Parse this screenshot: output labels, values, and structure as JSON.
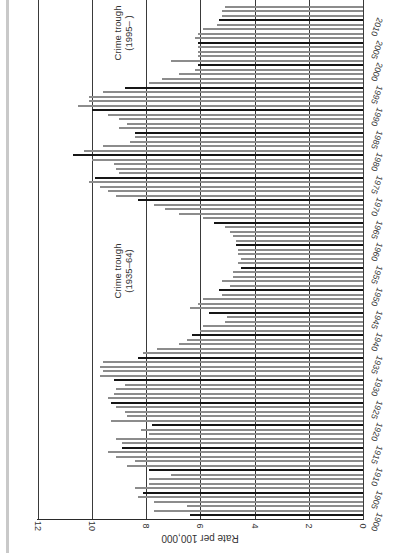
{
  "chart_data": {
    "type": "bar",
    "orientation": "rotated-90-ccw (years run bottom-to-top, values grow leftward)",
    "title": "",
    "xlabel": "",
    "ylabel": "Rate per 100,000",
    "ylim": [
      0,
      12
    ],
    "value_ticks": [
      "0",
      "2",
      "4",
      "6",
      "8",
      "10",
      "12"
    ],
    "year_ticks": [
      "1900",
      "1905",
      "1910",
      "1915",
      "1920",
      "1925",
      "1930",
      "1935",
      "1940",
      "1945",
      "1950",
      "1955",
      "1960",
      "1965",
      "1970",
      "1975",
      "1980",
      "1985",
      "1990",
      "1995",
      "2000",
      "2005",
      "2010"
    ],
    "grid": true,
    "highlight_every_5_years": true,
    "annotations": [
      {
        "line1": "Crime trough",
        "line2": "(1935–64)"
      },
      {
        "line1": "Crime trough",
        "line2": "(1995– )"
      }
    ],
    "categories": [
      1900,
      1901,
      1902,
      1903,
      1904,
      1905,
      1906,
      1907,
      1908,
      1909,
      1910,
      1911,
      1912,
      1913,
      1914,
      1915,
      1916,
      1917,
      1918,
      1919,
      1920,
      1921,
      1922,
      1923,
      1924,
      1925,
      1926,
      1927,
      1928,
      1929,
      1930,
      1931,
      1932,
      1933,
      1934,
      1935,
      1936,
      1937,
      1938,
      1939,
      1940,
      1941,
      1942,
      1943,
      1944,
      1945,
      1946,
      1947,
      1948,
      1949,
      1950,
      1951,
      1952,
      1953,
      1954,
      1955,
      1956,
      1957,
      1958,
      1959,
      1960,
      1961,
      1962,
      1963,
      1964,
      1965,
      1966,
      1967,
      1968,
      1969,
      1970,
      1971,
      1972,
      1973,
      1974,
      1975,
      1976,
      1977,
      1978,
      1979,
      1980,
      1981,
      1982,
      1983,
      1984,
      1985,
      1986,
      1987,
      1988,
      1989,
      1990,
      1991,
      1992,
      1993,
      1994,
      1995,
      1996,
      1997,
      1998,
      1999,
      2000,
      2001,
      2002,
      2003,
      2004,
      2005,
      2006,
      2007,
      2008,
      2009,
      2010,
      2011,
      2012,
      2013
    ],
    "values": [
      6.4,
      7.7,
      6.5,
      7.7,
      8.3,
      8.1,
      8.4,
      7.9,
      7.9,
      7.1,
      7.9,
      8.7,
      8.4,
      9.1,
      9.4,
      8.9,
      8.9,
      9.1,
      7.9,
      8.2,
      7.8,
      9.3,
      8.7,
      8.8,
      9.1,
      9.3,
      9.4,
      9.2,
      9.1,
      8.8,
      9.2,
      9.7,
      9.6,
      9.7,
      9.6,
      8.3,
      8.1,
      7.6,
      6.8,
      6.5,
      6.3,
      6.0,
      5.9,
      5.1,
      5.0,
      5.7,
      6.4,
      6.1,
      5.9,
      5.2,
      5.3,
      4.9,
      5.2,
      4.8,
      4.8,
      4.5,
      4.6,
      4.5,
      4.6,
      4.6,
      4.7,
      4.7,
      4.8,
      4.9,
      5.1,
      5.5,
      5.9,
      6.8,
      7.3,
      7.7,
      8.3,
      9.1,
      9.4,
      9.7,
      10.1,
      9.9,
      9.0,
      9.1,
      9.2,
      10.0,
      10.7,
      10.3,
      9.6,
      8.6,
      8.4,
      8.4,
      9.0,
      8.7,
      9.0,
      9.4,
      10.0,
      10.5,
      10.1,
      10.1,
      9.6,
      8.8,
      7.9,
      7.4,
      6.8,
      6.2,
      6.1,
      7.1,
      6.1,
      6.1,
      6.1,
      6.1,
      6.2,
      6.1,
      5.9,
      5.4,
      5.3,
      5.2,
      5.2,
      5.1
    ]
  },
  "colors": {
    "bar": "#8c8c8c",
    "bar_major": "#161616",
    "grid": "#3a3a3a",
    "background": "#ffffff"
  }
}
